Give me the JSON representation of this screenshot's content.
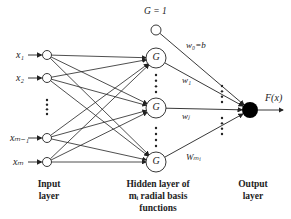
{
  "inputs": [
    {
      "label": "x₁"
    },
    {
      "label": "x₂"
    },
    {
      "label": "xₘ₋₁"
    },
    {
      "label": "xₘ"
    }
  ],
  "bias": {
    "label": "G = 1"
  },
  "hidden": [
    {
      "label": "G"
    },
    {
      "label": "G"
    },
    {
      "label": "G"
    }
  ],
  "weights": {
    "w0": "w₀=b",
    "w1": "w₁",
    "wj": "wⱼ",
    "wm": "Wₘᵢ"
  },
  "output": {
    "label": "F(x)"
  },
  "captions": {
    "input": "Input layer",
    "hidden": "Hidden layer of mᵢ radial basis functions",
    "output": "Output layer"
  },
  "ellipsis": "⋮",
  "colors": {
    "line": "#222222",
    "output_node": "#000000"
  }
}
